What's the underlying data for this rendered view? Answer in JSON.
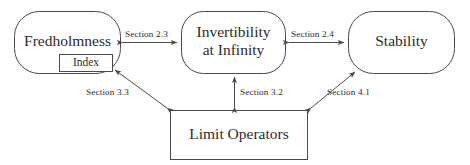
{
  "diagram": {
    "line_color": "#4a4a4a",
    "text_color": "#2b2b2b",
    "background": "#ffffff",
    "nodes": [
      {
        "id": "fredholmness",
        "label": "Fredholmness",
        "shape": "rounded-rectangle"
      },
      {
        "id": "index",
        "label": "Index",
        "shape": "rectangle"
      },
      {
        "id": "invertibility",
        "label_line1": "Invertibility",
        "label_line2": "at Infinity",
        "shape": "rounded-rectangle"
      },
      {
        "id": "stability",
        "label": "Stability",
        "shape": "rounded-rectangle"
      },
      {
        "id": "limit-operators",
        "label": "Limit Operators",
        "shape": "rectangle"
      }
    ],
    "edges": [
      {
        "id": "edge-2-3",
        "label": "Section 2.3",
        "from": "fredholmness",
        "to": "invertibility",
        "arrows": "both",
        "orientation": "horizontal"
      },
      {
        "id": "edge-2-4",
        "label": "Section 2.4",
        "from": "invertibility",
        "to": "stability",
        "arrows": "both",
        "orientation": "horizontal"
      },
      {
        "id": "edge-3-3",
        "label": "Section 3.3",
        "from": "limit-operators",
        "to": "index",
        "arrows": "both",
        "orientation": "diagonal"
      },
      {
        "id": "edge-3-2",
        "label": "Section 3.2",
        "from": "limit-operators",
        "to": "invertibility",
        "arrows": "both",
        "orientation": "vertical"
      },
      {
        "id": "edge-4-1",
        "label": "Section 4.1",
        "from": "limit-operators",
        "to": "stability",
        "arrows": "both",
        "orientation": "diagonal"
      }
    ]
  }
}
